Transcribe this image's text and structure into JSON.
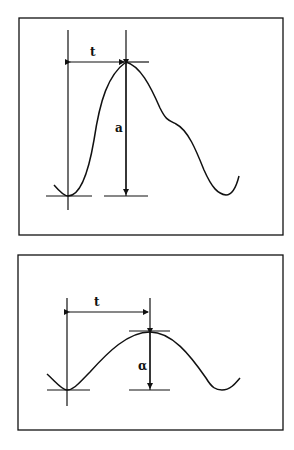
{
  "figures": [
    {
      "id": "top",
      "description": "Asymmetric pulse with dicrotic shoulder",
      "labels": {
        "time": "t",
        "amplitude": "a"
      }
    },
    {
      "id": "bottom",
      "description": "Symmetric sinusoidal-like pulse",
      "labels": {
        "time": "t",
        "amplitude": "α"
      }
    }
  ],
  "colors": {
    "stroke": "#111111",
    "background": "#ffffff"
  }
}
